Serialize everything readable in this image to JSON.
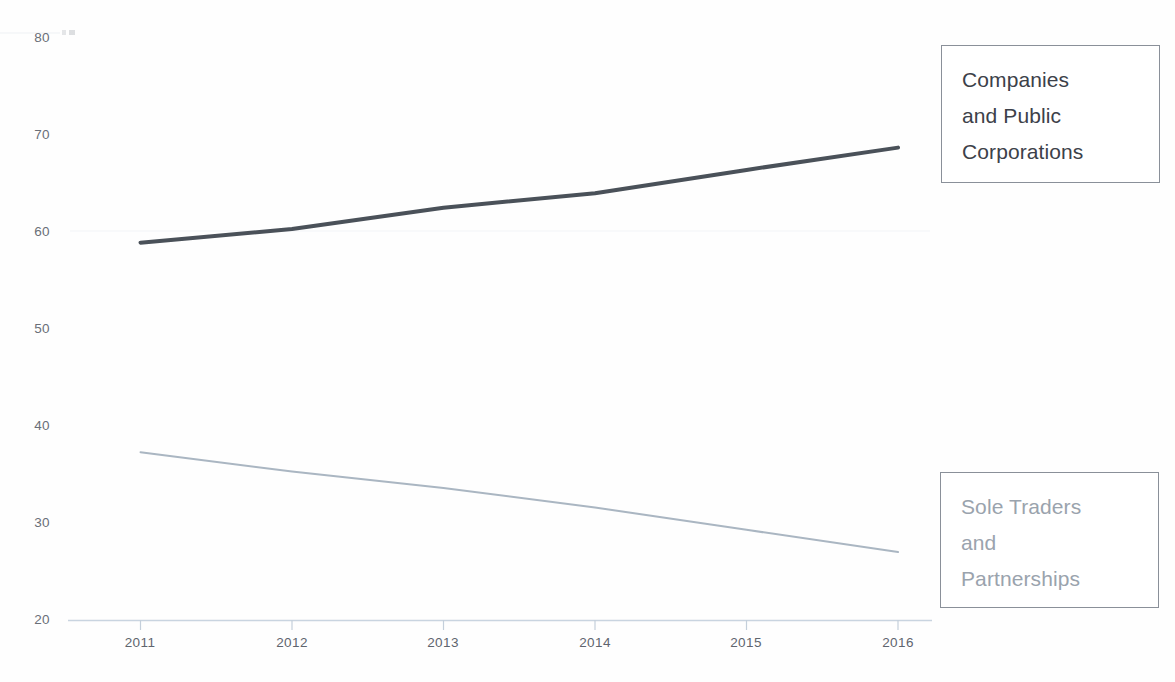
{
  "chart_data": {
    "type": "line",
    "title": "",
    "subtitle": "",
    "xlabel": "",
    "ylabel": "",
    "categories": [
      "2011",
      "2012",
      "2013",
      "2014",
      "2015",
      "2016"
    ],
    "x": [
      2011,
      2012,
      2013,
      2014,
      2015,
      2016
    ],
    "xlim": [
      2011,
      2016
    ],
    "ylim": [
      20,
      80
    ],
    "y_ticks": [
      20,
      30,
      40,
      50,
      60,
      70,
      80
    ],
    "y_tick_labels": [
      "20",
      "30",
      "40",
      "50",
      "60",
      "70",
      "80"
    ],
    "x_ticks": [
      2011,
      2012,
      2013,
      2014,
      2015,
      2016
    ],
    "x_tick_labels": [
      "2011",
      "2012",
      "2013",
      "2014",
      "2015",
      "2016"
    ],
    "grid": false,
    "legend_position": "right",
    "series": [
      {
        "name": "Companies and Public Corporations",
        "values": [
          58.9,
          60.3,
          62.5,
          64.0,
          66.4,
          68.7
        ],
        "color": "#4a5159",
        "line_width": 4
      },
      {
        "name": "Sole Traders and Partnerships",
        "values": [
          37.3,
          35.3,
          33.6,
          31.6,
          29.3,
          27.0
        ],
        "color": "#aab6c2",
        "line_width": 2
      }
    ]
  },
  "axes": {
    "y_labels": [
      "80",
      "70",
      "60",
      "50",
      "40",
      "30",
      "20"
    ],
    "x_labels": [
      "2011",
      "2012",
      "2013",
      "2014",
      "2015",
      "2016"
    ],
    "axis_color": "#c9d4e0"
  },
  "legend": {
    "companies": {
      "label": "Companies\nand Public\nCorporations",
      "color": "#3c4149",
      "border_color": "#8a9099"
    },
    "sole_traders": {
      "label": "Sole Traders\nand\nPartnerships",
      "color": "#9aa3ad",
      "border_color": "#8a9099"
    }
  }
}
